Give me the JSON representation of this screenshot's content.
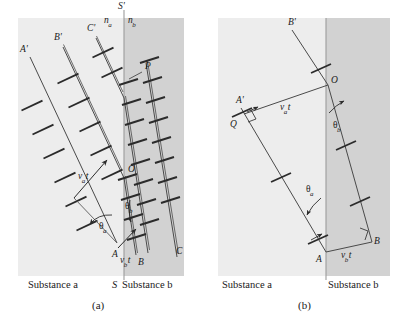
{
  "figure": {
    "type": "refraction-wavefront-diagram",
    "background": "#ffffff",
    "substance_a_fill": "#eeeeee",
    "substance_b_fill": "#d2d2d2",
    "line_color": "#3a3a3a",
    "boundary_color": "#9a9a9a",
    "text_color": "#1a1a1a"
  },
  "panel_a": {
    "caption": "(a)",
    "substance_left": "Substance a",
    "substance_right": "Substance b",
    "boundary_top_label": "S'",
    "boundary_bottom_label": "S",
    "index_left": "n",
    "index_left_sub": "a",
    "index_right": "n",
    "index_right_sub": "b",
    "ray_labels": {
      "ray1_top": "A'",
      "ray2_top": "B'",
      "ray3_top": "C'",
      "point_P": "P",
      "point_O": "O",
      "point_A": "A",
      "point_B": "B",
      "point_C": "C"
    },
    "angles": {
      "theta_a": "θ",
      "theta_a_sub": "a",
      "theta_b": "θ",
      "theta_b_sub": "b"
    },
    "distances": {
      "va_t": "v",
      "va_t_sub": "a",
      "va_t_suffix": "t",
      "vb_t": "v",
      "vb_t_sub": "b",
      "vb_t_suffix": "t"
    }
  },
  "panel_b": {
    "caption": "(b)",
    "substance_left": "Substance a",
    "substance_right": "Substance b",
    "ray_labels": {
      "ray_top": "B'",
      "ray_left": "A'",
      "point_Q": "Q",
      "point_O": "O",
      "point_A": "A",
      "point_B": "B"
    },
    "angles": {
      "theta_a": "θ",
      "theta_a_sub": "a",
      "theta_b": "θ",
      "theta_b_sub": "b"
    },
    "distances": {
      "va_t": "v",
      "va_t_sub": "a",
      "va_t_suffix": "t",
      "vb_t": "v",
      "vb_t_sub": "b",
      "vb_t_suffix": "t"
    }
  }
}
